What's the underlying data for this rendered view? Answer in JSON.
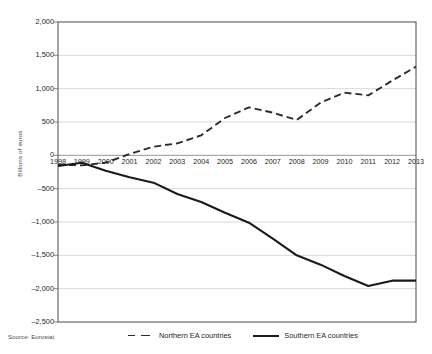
{
  "chart_data": {
    "type": "line",
    "title": "",
    "xlabel": "",
    "ylabel": "Billions of euros",
    "ylim": [
      -2500,
      2000
    ],
    "ytick_values": [
      2000,
      1500,
      1000,
      500,
      0,
      -500,
      -1000,
      -1500,
      -2000,
      -2500
    ],
    "ytick_labels": [
      "2,000",
      "1,500",
      "1,000",
      "500",
      "0",
      "-500",
      "-1,000",
      "-1,500",
      "-2,000",
      "-2,500"
    ],
    "grid": true,
    "grid_axis": "y",
    "legend_position": "bottom",
    "categories": [
      "1998",
      "1999",
      "2000",
      "2001",
      "2002",
      "2003",
      "2004",
      "2005",
      "2006",
      "2007",
      "2008",
      "2009",
      "2010",
      "2011",
      "2012",
      "2013"
    ],
    "x": [
      1998,
      1999,
      2000,
      2001,
      2002,
      2003,
      2004,
      2005,
      2006,
      2007,
      2008,
      2009,
      2010,
      2011,
      2012,
      2013
    ],
    "series": [
      {
        "name": "Northern EA countries",
        "style": "dashed",
        "color": "#2b2b2b",
        "values": [
          -140,
          -150,
          -110,
          20,
          130,
          180,
          300,
          560,
          720,
          640,
          530,
          790,
          940,
          900,
          1120,
          1330
        ]
      },
      {
        "name": "Southern EA countries",
        "style": "solid",
        "color": "#1a1a1a",
        "values": [
          -160,
          -110,
          -230,
          -330,
          -410,
          -580,
          -700,
          -860,
          -1010,
          -1250,
          -1500,
          -1640,
          -1810,
          -1960,
          -1880,
          -1880
        ]
      }
    ],
    "annotations": []
  },
  "source_note": "Source: Eurostat",
  "legend": {
    "entries": [
      {
        "label": "Northern EA countries",
        "marker": "dashed-line-swatch"
      },
      {
        "label": "Southern EA countries",
        "marker": "solid-line-swatch"
      }
    ]
  },
  "axes": {
    "y_title": "Billions of euros"
  }
}
